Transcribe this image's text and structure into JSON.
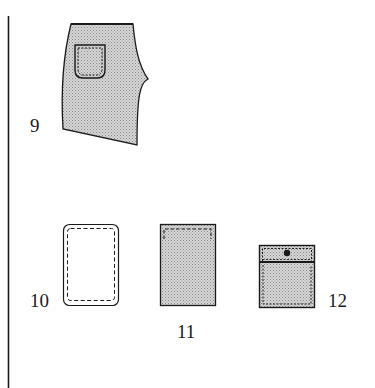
{
  "figure": {
    "type": "garment-illustration",
    "colors": {
      "ink": "#1a1a1a",
      "shade": "#c8c8c8",
      "paper": "#ffffff"
    },
    "items": [
      {
        "id": "9",
        "label": "9",
        "description": "shorts panel with patch pocket",
        "icon": "shorts-panel"
      },
      {
        "id": "10",
        "label": "10",
        "description": "unshaded patch pocket with rounded corners and dashed stitching",
        "icon": "pocket-outline"
      },
      {
        "id": "11",
        "label": "11",
        "description": "shaded rectangular patch pocket with top-stitching",
        "icon": "pocket-shaded"
      },
      {
        "id": "12",
        "label": "12",
        "description": "shaded patch pocket with flap and button",
        "icon": "pocket-flap-button"
      }
    ]
  }
}
